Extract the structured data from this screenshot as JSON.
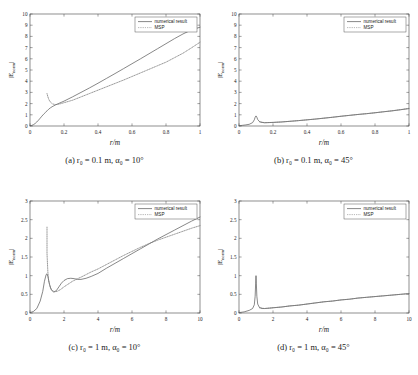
{
  "figure": {
    "axis_labels": {
      "x": "r/m",
      "y": "|E_norm|"
    },
    "legend": {
      "numerical": "numerical result",
      "msp": "MSP"
    },
    "colors": {
      "numerical": "#555555",
      "msp": "#777777",
      "axis": "#444444",
      "grid": "#bbbbbb"
    }
  },
  "captions": {
    "a": "(a)  r₀ = 0.1 m, α₀ = 10°",
    "b": "(b)  r₀ = 0.1 m, α₀ = 45°",
    "c": "(c)  r₀ = 1 m, α₀ = 10°",
    "d": "(d)  r₀ = 1 m, α₀ = 45°"
  },
  "chart_data": [
    {
      "id": "a",
      "type": "line",
      "title": "(a) r0 = 0.1 m, alpha0 = 10 deg",
      "xlabel": "r/m",
      "ylabel": "|E_norm|",
      "xlim": [
        0,
        1
      ],
      "ylim": [
        0,
        10
      ],
      "xticks": [
        0,
        0.2,
        0.4,
        0.6,
        0.8,
        1
      ],
      "xticklabels": [
        "0",
        "0.2",
        "0.4",
        "0.6",
        "0.8",
        "1"
      ],
      "yticks": [
        0,
        1,
        2,
        3,
        4,
        5,
        6,
        7,
        8,
        9,
        10
      ],
      "yticklabels": [
        "0",
        "1",
        "2",
        "3",
        "4",
        "5",
        "6",
        "7",
        "8",
        "9",
        "10"
      ],
      "grid": false,
      "legend_position": "top-right",
      "series": [
        {
          "name": "numerical result",
          "style": "solid",
          "x": [
            0,
            0.01,
            0.02,
            0.03,
            0.04,
            0.05,
            0.06,
            0.07,
            0.08,
            0.09,
            0.1,
            0.11,
            0.12,
            0.13,
            0.14,
            0.15,
            0.17,
            0.2,
            0.25,
            0.3,
            0.35,
            0.4,
            0.45,
            0.5,
            0.55,
            0.6,
            0.65,
            0.7,
            0.75,
            0.8,
            0.85,
            0.9,
            0.95,
            1
          ],
          "y": [
            0.02,
            0.05,
            0.12,
            0.22,
            0.36,
            0.52,
            0.7,
            0.88,
            1.05,
            1.2,
            1.35,
            1.5,
            1.62,
            1.72,
            1.8,
            1.88,
            2.02,
            2.22,
            2.6,
            3.0,
            3.4,
            3.82,
            4.25,
            4.68,
            5.12,
            5.56,
            6.0,
            6.45,
            6.9,
            7.35,
            7.8,
            8.22,
            8.58,
            8.82
          ]
        },
        {
          "name": "MSP",
          "style": "dotted",
          "x": [
            0.1,
            0.105,
            0.11,
            0.115,
            0.12,
            0.13,
            0.14,
            0.15,
            0.16,
            0.18,
            0.2,
            0.25,
            0.3,
            0.35,
            0.4,
            0.45,
            0.5,
            0.55,
            0.6,
            0.65,
            0.7,
            0.75,
            0.8,
            0.85,
            0.9,
            0.95,
            1
          ],
          "y": [
            2.9,
            2.62,
            2.4,
            2.25,
            2.14,
            2.0,
            1.94,
            1.92,
            1.93,
            1.99,
            2.08,
            2.3,
            2.6,
            2.9,
            3.2,
            3.5,
            3.8,
            4.1,
            4.42,
            4.74,
            5.06,
            5.38,
            5.7,
            6.1,
            6.5,
            6.98,
            7.48
          ]
        }
      ]
    },
    {
      "id": "b",
      "type": "line",
      "title": "(b) r0 = 0.1 m, alpha0 = 45 deg",
      "xlabel": "r/m",
      "ylabel": "|E_norm|",
      "xlim": [
        0,
        1
      ],
      "ylim": [
        0,
        10
      ],
      "xticks": [
        0,
        0.2,
        0.4,
        0.6,
        0.8,
        1
      ],
      "xticklabels": [
        "0",
        "0.2",
        "0.4",
        "0.6",
        "0.8",
        "1"
      ],
      "yticks": [
        0,
        1,
        2,
        3,
        4,
        5,
        6,
        7,
        8,
        9,
        10
      ],
      "yticklabels": [
        "0",
        "1",
        "2",
        "3",
        "4",
        "5",
        "6",
        "7",
        "8",
        "9",
        "10"
      ],
      "grid": false,
      "legend_position": "top-right",
      "series": [
        {
          "name": "numerical result",
          "style": "solid",
          "x": [
            0,
            0.02,
            0.04,
            0.06,
            0.08,
            0.09,
            0.095,
            0.1,
            0.105,
            0.11,
            0.12,
            0.13,
            0.15,
            0.17,
            0.2,
            0.25,
            0.3,
            0.35,
            0.4,
            0.45,
            0.5,
            0.55,
            0.6,
            0.65,
            0.7,
            0.75,
            0.8,
            0.85,
            0.9,
            0.95,
            1
          ],
          "y": [
            0.02,
            0.06,
            0.1,
            0.15,
            0.3,
            0.55,
            0.78,
            0.9,
            0.78,
            0.58,
            0.4,
            0.33,
            0.29,
            0.3,
            0.32,
            0.36,
            0.42,
            0.48,
            0.55,
            0.62,
            0.7,
            0.78,
            0.87,
            0.95,
            1.03,
            1.1,
            1.18,
            1.27,
            1.35,
            1.45,
            1.55
          ]
        },
        {
          "name": "MSP",
          "style": "dotted",
          "x": [
            0.12,
            0.15,
            0.2,
            0.25,
            0.3,
            0.35,
            0.4,
            0.45,
            0.5,
            0.55,
            0.6,
            0.65,
            0.7,
            0.75,
            0.8,
            0.85,
            0.9,
            0.95,
            1
          ],
          "y": [
            0.38,
            0.3,
            0.32,
            0.36,
            0.42,
            0.48,
            0.55,
            0.62,
            0.7,
            0.78,
            0.87,
            0.95,
            1.03,
            1.1,
            1.18,
            1.27,
            1.36,
            1.46,
            1.58
          ]
        }
      ]
    },
    {
      "id": "c",
      "type": "line",
      "title": "(c) r0 = 1 m, alpha0 = 10 deg",
      "xlabel": "r/m",
      "ylabel": "|E_norm|",
      "xlim": [
        0,
        10
      ],
      "ylim": [
        0,
        3
      ],
      "xticks": [
        0,
        2,
        4,
        6,
        8,
        10
      ],
      "xticklabels": [
        "0",
        "2",
        "4",
        "6",
        "8",
        "10"
      ],
      "yticks": [
        0,
        0.5,
        1,
        1.5,
        2,
        2.5,
        3
      ],
      "yticklabels": [
        "0",
        "0.5",
        "1",
        "1.5",
        "2",
        "2.5",
        "3"
      ],
      "grid": false,
      "legend_position": "top-right",
      "series": [
        {
          "name": "numerical result",
          "style": "solid",
          "x": [
            0,
            0.2,
            0.4,
            0.6,
            0.75,
            0.85,
            0.95,
            1.0,
            1.05,
            1.15,
            1.25,
            1.4,
            1.55,
            1.7,
            1.85,
            2.0,
            2.2,
            2.4,
            2.6,
            2.8,
            3.0,
            3.3,
            3.6,
            4.0,
            4.5,
            5.0,
            5.5,
            6.0,
            6.5,
            7.0,
            7.5,
            8.0,
            8.5,
            9.0,
            9.5,
            10
          ],
          "y": [
            0.01,
            0.04,
            0.12,
            0.32,
            0.58,
            0.85,
            1.03,
            1.05,
            0.98,
            0.76,
            0.62,
            0.56,
            0.6,
            0.7,
            0.8,
            0.87,
            0.92,
            0.93,
            0.92,
            0.9,
            0.9,
            0.93,
            0.98,
            1.06,
            1.2,
            1.33,
            1.46,
            1.59,
            1.72,
            1.85,
            1.98,
            2.1,
            2.22,
            2.34,
            2.46,
            2.57
          ]
        },
        {
          "name": "MSP",
          "style": "dotted",
          "x": [
            1.0,
            1.0,
            1.05,
            1.1,
            1.2,
            1.3,
            1.45,
            1.6,
            1.8,
            2.0,
            2.2,
            2.5,
            2.8,
            3.0,
            3.3,
            3.6,
            4.0,
            4.5,
            5.0,
            5.5,
            6.0,
            6.5,
            7.0,
            7.5,
            8.0,
            8.5,
            9.0,
            9.5,
            10
          ],
          "y": [
            2.3,
            1.6,
            1.1,
            0.86,
            0.68,
            0.6,
            0.57,
            0.58,
            0.63,
            0.7,
            0.76,
            0.85,
            0.92,
            0.96,
            1.03,
            1.1,
            1.18,
            1.3,
            1.42,
            1.54,
            1.65,
            1.76,
            1.86,
            1.95,
            2.03,
            2.11,
            2.19,
            2.27,
            2.34
          ]
        }
      ]
    },
    {
      "id": "d",
      "type": "line",
      "title": "(d) r0 = 1 m, alpha0 = 45 deg",
      "xlabel": "r/m",
      "ylabel": "|E_norm|",
      "xlim": [
        0,
        10
      ],
      "ylim": [
        0,
        3
      ],
      "xticks": [
        0,
        2,
        4,
        6,
        8,
        10
      ],
      "xticklabels": [
        "0",
        "2",
        "4",
        "6",
        "8",
        "10"
      ],
      "yticks": [
        0,
        0.5,
        1,
        1.5,
        2,
        2.5,
        3
      ],
      "yticklabels": [
        "0",
        "0.5",
        "1",
        "1.5",
        "2",
        "2.5",
        "3"
      ],
      "grid": false,
      "legend_position": "top-right",
      "series": [
        {
          "name": "numerical result",
          "style": "solid",
          "x": [
            0,
            0.3,
            0.6,
            0.8,
            0.9,
            0.95,
            0.98,
            1.0,
            1.02,
            1.05,
            1.1,
            1.2,
            1.35,
            1.5,
            1.8,
            2.0,
            2.5,
            3.0,
            3.5,
            4.0,
            4.5,
            5.0,
            5.5,
            6.0,
            6.5,
            7.0,
            7.5,
            8.0,
            8.5,
            9.0,
            9.5,
            10
          ],
          "y": [
            0.01,
            0.03,
            0.07,
            0.12,
            0.22,
            0.45,
            0.8,
            1.0,
            0.8,
            0.45,
            0.24,
            0.15,
            0.12,
            0.12,
            0.13,
            0.14,
            0.16,
            0.19,
            0.21,
            0.24,
            0.27,
            0.3,
            0.32,
            0.35,
            0.37,
            0.4,
            0.42,
            0.44,
            0.46,
            0.48,
            0.5,
            0.52
          ]
        },
        {
          "name": "MSP",
          "style": "dotted",
          "x": [
            1.2,
            1.5,
            2.0,
            2.5,
            3.0,
            3.5,
            4.0,
            4.5,
            5.0,
            5.5,
            6.0,
            6.5,
            7.0,
            7.5,
            8.0,
            8.5,
            9.0,
            9.5,
            10
          ],
          "y": [
            0.14,
            0.12,
            0.14,
            0.16,
            0.19,
            0.21,
            0.24,
            0.27,
            0.3,
            0.32,
            0.35,
            0.37,
            0.4,
            0.42,
            0.44,
            0.46,
            0.48,
            0.5,
            0.52
          ]
        }
      ]
    }
  ]
}
